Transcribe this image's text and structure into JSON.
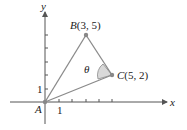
{
  "diagram": {
    "axes": {
      "x_label": "x",
      "y_label": "y",
      "tick_label_x": "1",
      "tick_label_y": "1"
    },
    "points": {
      "A": {
        "name": "A",
        "coords": ""
      },
      "B": {
        "name": "B",
        "coords": "(3, 5)"
      },
      "C": {
        "name": "C",
        "coords": "(5, 2)"
      }
    },
    "angle_label": "θ",
    "colors": {
      "line": "#8a8a8a",
      "axis": "#555555",
      "shade": "#d9d9d9",
      "point": "#888888"
    }
  }
}
